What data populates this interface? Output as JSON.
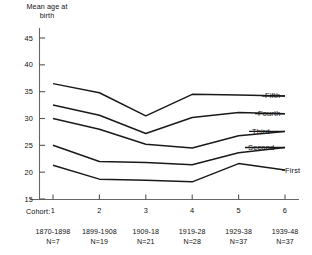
{
  "chart_data": {
    "type": "line",
    "title": "",
    "ylabel": "Mean age at\nbirth",
    "xlabel": "Cohort:",
    "ylim": [
      15,
      45
    ],
    "yticks": [
      45,
      40,
      35,
      30,
      25,
      20,
      15
    ],
    "grid": false,
    "legend_position": "right-inline",
    "categories": [
      "1",
      "2",
      "3",
      "4",
      "5",
      "6"
    ],
    "x": [
      1,
      2,
      3,
      4,
      5,
      6
    ],
    "cohort_years": [
      "1870-1898",
      "1899-1908",
      "1909-18",
      "1919-28",
      "1929-38",
      "1939-48"
    ],
    "cohort_n": [
      "N=7",
      "N=19",
      "N=21",
      "N=28",
      "N=37",
      "N=37"
    ],
    "series": [
      {
        "name": "Fifth",
        "values": [
          36.5,
          34.8,
          30.5,
          34.5,
          34.4,
          34.2
        ]
      },
      {
        "name": "Fourth",
        "values": [
          32.5,
          30.6,
          27.2,
          30.2,
          31.1,
          30.9
        ]
      },
      {
        "name": "Third",
        "values": [
          30.0,
          28.0,
          25.2,
          24.5,
          26.8,
          27.6
        ]
      },
      {
        "name": "Second",
        "values": [
          25.0,
          22.0,
          21.8,
          21.4,
          23.6,
          24.6
        ]
      },
      {
        "name": "First",
        "values": [
          21.3,
          18.7,
          18.5,
          18.2,
          21.6,
          20.4
        ]
      }
    ]
  },
  "axis": {
    "y_title": "Mean age at\nbirth",
    "y_tick_45": "45",
    "y_tick_40": "40",
    "y_tick_35": "35",
    "y_tick_30": "30",
    "y_tick_25": "25",
    "y_tick_20": "20",
    "y_tick_15": "15",
    "cohort_caption": "Cohort:",
    "x_tick_1": "1",
    "x_tick_2": "2",
    "x_tick_3": "3",
    "x_tick_4": "4",
    "x_tick_5": "5",
    "x_tick_6": "6"
  },
  "cohorts": [
    {
      "years": "1870-1898",
      "n": "N=7"
    },
    {
      "years": "1899-1908",
      "n": "N=19"
    },
    {
      "years": "1909-18",
      "n": "N=21"
    },
    {
      "years": "1919-28",
      "n": "N=28"
    },
    {
      "years": "1929-38",
      "n": "N=37"
    },
    {
      "years": "1939-48",
      "n": "N=37"
    }
  ],
  "series_labels": {
    "fifth": "Fifth",
    "fourth": "Fourth",
    "third": "Third",
    "second": "Second",
    "first": "First"
  },
  "colors": {
    "line": "#1a1a1a",
    "axis": "#555555",
    "background": "#ffffff"
  }
}
